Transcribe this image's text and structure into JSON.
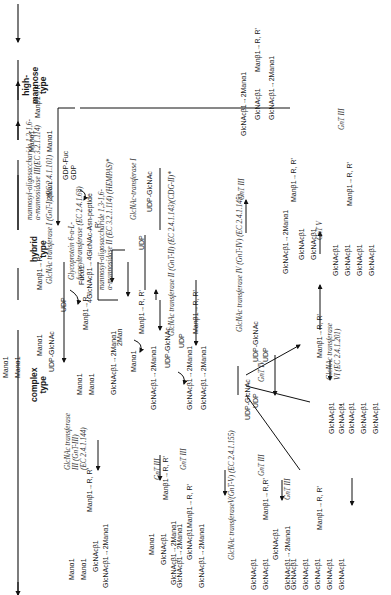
{
  "categories": {
    "high_mannose": "high-\nmannose\ntype",
    "hybrid": "hybrid\ntype",
    "complex": "complex\ntype"
  },
  "category_lines": [
    "high-",
    "mannose",
    "type",
    "hybrid",
    "type",
    "complex",
    "type"
  ],
  "structures": {
    "s1": [
      "Manα1→6",
      "Manα1→3",
      "Manβ1→R"
    ],
    "s1_top": "Manα1",
    "s1_mid": "6",
    "s1_row": "Manβ1→R",
    "s2_a": "Manα1",
    "s2_b": "Manα1",
    "s2_c": "Manα1",
    "s2_core": "Manβ1→R",
    "s3_a": "Manα1",
    "s3_b": "Manα1",
    "s3_c": "GlcNAcβ1→2Manα1",
    "s3_core": "Manβ1→R,",
    "s3_fuc": "Fucα1",
    "s3_glcnac": "4GlcNAcβ1→4GlcNAc-Asn-peptide",
    "s3_r": "R'",
    "s4_a": "Manα1",
    "s4_b": "GlcNAcβ1→2Manα1",
    "s4_core": "Manβ1→R, R'",
    "s5_a": "GlcNAcβ1→2Manα1",
    "s5_b": "GlcNAcβ1→2Manα1",
    "s5_core": "Manβ1→R, R'",
    "s6_a": "GlcNAcβ1→2Manα1",
    "s6_b": "GlcNAcβ1",
    "s6_c": "GlcNAcβ1",
    "s6_d": "Manα1",
    "s6_core": "Manβ1→R, R'",
    "s7_a": "GlcNAcβ1",
    "s7_b": "GlcNAcβ1",
    "s7_c": "GlcNAcβ1",
    "s7_d": "GlcNAcβ1",
    "s7_core": "Manβ1→R, R'",
    "s8_core": "Manβ1→R, R'",
    "h1_a": "Manα1",
    "h1_b": "Manα1",
    "h1_c": "GlcNAcβ1",
    "h1_d": "GlcNAcβ1→2Manα1",
    "h1_core": "Manβ1→R, R'",
    "h2_a": "Manα1",
    "h2_b": "GlcNAcβ1",
    "h2_c": "GlcNAcβ1→2Manα1",
    "h2_core": "Manβ1→R, R'",
    "c1_a": "GlcNAcβ1→2Manα1",
    "c1_b": "GlcNAcβ1",
    "c1_c": "GlcNAcβ1→2Manα1",
    "c1_core": "Manβ1→R, R'",
    "c2_a": "GlcNAcβ1",
    "c2_b": "GlcNAcβ1",
    "c2_c": "GlcNAcβ1",
    "c2_d": "GlcNAcβ1→2Manα1",
    "c2_core": "Manβ1→R,R'",
    "c3_a": "GlcNAcβ1",
    "c3_b": "GlcNAcβ1",
    "c3_c": "GlcNAcβ1",
    "c3_d": "GlcNAcβ1",
    "c3_e": "GlcNAcβ1",
    "c3_core": "Manβ1→R, R'"
  },
  "enzymes": {
    "mannosidase_iii": "mannosyl-oligosaccharide 1,3-1,6-",
    "mannosidase_iii_b": "α-mannosidase III(EC 3.2.1.114)",
    "gnt1": "GlcNAc transferase I (GnT-I) (EC 2.4.1.101)",
    "fuct_a": "Glycoprotein 6-α-L-",
    "fuct_b": "fucosyltransferase (EC 2.4.1.68)",
    "mannosidase_ii_a": "mannosyl-oligosaccharide 1,3-1,6-",
    "mannosidase_ii_b": "α-mannosidase II (EC 3.2.1.114)  (HEMPAS)*",
    "gnt1_short": "GlcNAc-transferase I",
    "gnt2": "GlcNAc transferase II (GnT-II) (EC 2.4.1.143)(CDG-II)*",
    "gnt4": "GlcNAc transferase IV (GnT-IV) (EC 2.4.1.145)",
    "gnt3_a": "GlcNAc transferase",
    "gnt3_b": "III (GnT-III)",
    "gnt3_c": "(EC 2.4.1.144)",
    "gnt5": "GlcNAc transferaseV(GnT-V) (EC 2.4.1.155)",
    "gnt6_a": "GlcNAc transferase",
    "gnt6_b": "VI   (EC 2.4.1.201)",
    "gnt_iii": "GnT III",
    "gnt_iv": "GnT IV",
    "gnt_v": "GnT V"
  },
  "cofactors": {
    "two_man": "2Man",
    "udp_glcnac": "UDP-GlcNAc",
    "udp": "UDP",
    "gdp_fuc": "GDP-Fuc",
    "gdp": "GDP"
  }
}
